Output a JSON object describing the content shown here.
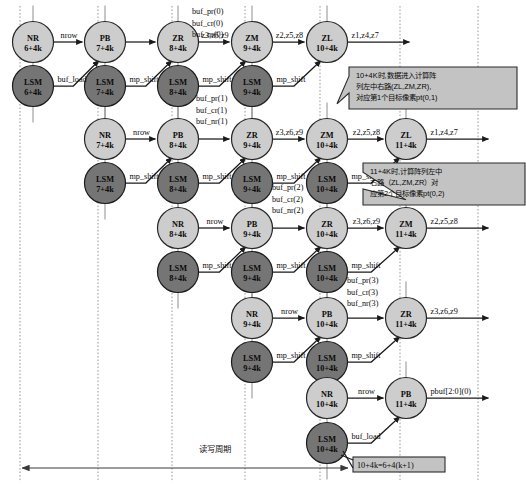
{
  "diagram": {
    "colors": {
      "node_light": "#cdcdcd",
      "node_dark": "#757575",
      "note_fill": "#c3c3c3",
      "edge": "#1a1a1a",
      "grid": "#9a9a9a"
    },
    "grid_columns_x": [
      20,
      98,
      172,
      245,
      320,
      400,
      478
    ],
    "rows": [
      {
        "index": 0,
        "top_nodes": [
          {
            "name": "NR",
            "cycle": "6+4k",
            "x": 33,
            "y": 42,
            "shade": "light"
          },
          {
            "name": "PB",
            "cycle": "7+4k",
            "x": 105,
            "y": 42,
            "shade": "light"
          },
          {
            "name": "ZR",
            "cycle": "8+4k",
            "x": 178,
            "y": 42,
            "shade": "light"
          },
          {
            "name": "ZM",
            "cycle": "9+4k",
            "x": 252,
            "y": 42,
            "shade": "light"
          },
          {
            "name": "ZL",
            "cycle": "10+4k",
            "x": 327,
            "y": 42,
            "shade": "light"
          }
        ],
        "bottom_nodes": [
          {
            "name": "LSM",
            "cycle": "6+4k",
            "x": 33,
            "y": 86,
            "shade": "dark"
          },
          {
            "name": "LSM",
            "cycle": "7+4k",
            "x": 105,
            "y": 86,
            "shade": "dark"
          },
          {
            "name": "LSM",
            "cycle": "8+4k",
            "x": 178,
            "y": 86,
            "shade": "dark"
          },
          {
            "name": "LSM",
            "cycle": "9+4k",
            "x": 252,
            "y": 86,
            "shade": "dark"
          }
        ],
        "top_edge_labels": [
          "nrow",
          "",
          "z3,z6,z9",
          "z2,z5,z8"
        ],
        "exit_label": "z1,z4,z7",
        "diag_labels": [
          "buf_load",
          "mp_shift",
          "mp_shift",
          "mp_shift"
        ],
        "stack_label": [
          "buf_pr(0)",
          "buf_cr(0)",
          "buf_nr(0)"
        ],
        "stack_label_x": 192,
        "stack_label_y": 14
      },
      {
        "index": 1,
        "top_nodes": [
          {
            "name": "NR",
            "cycle": "7+4k",
            "x": 105,
            "y": 139,
            "shade": "light"
          },
          {
            "name": "PB",
            "cycle": "8+4k",
            "x": 178,
            "y": 139,
            "shade": "light"
          },
          {
            "name": "ZR",
            "cycle": "9+4k",
            "x": 252,
            "y": 139,
            "shade": "light"
          },
          {
            "name": "ZM",
            "cycle": "10+4k",
            "x": 327,
            "y": 139,
            "shade": "light"
          },
          {
            "name": "ZL",
            "cycle": "11+4k",
            "x": 406,
            "y": 139,
            "shade": "light"
          }
        ],
        "bottom_nodes": [
          {
            "name": "LSM",
            "cycle": "7+4k",
            "x": 105,
            "y": 183,
            "shade": "dark"
          },
          {
            "name": "LSM",
            "cycle": "8+4k",
            "x": 178,
            "y": 183,
            "shade": "dark"
          },
          {
            "name": "LSM",
            "cycle": "9+4k",
            "x": 252,
            "y": 183,
            "shade": "dark"
          },
          {
            "name": "LSM",
            "cycle": "10+4k",
            "x": 327,
            "y": 183,
            "shade": "dark"
          }
        ],
        "top_edge_labels": [
          "nrow",
          "",
          "z3,z6,z9",
          "z2,z5,z8"
        ],
        "exit_label": "z1,z4,z7",
        "diag_labels": [
          "mp_shift",
          "mp_shift",
          "mp_shift",
          "mp_shift"
        ],
        "stack_label": [
          "buf_pr(1)",
          "buf_cr(1)",
          "buf_nr(1)"
        ],
        "stack_label_x": 196,
        "stack_label_y": 101
      },
      {
        "index": 2,
        "top_nodes": [
          {
            "name": "NR",
            "cycle": "8+4k",
            "x": 178,
            "y": 228,
            "shade": "light"
          },
          {
            "name": "PB",
            "cycle": "9+4k",
            "x": 252,
            "y": 228,
            "shade": "light"
          },
          {
            "name": "ZR",
            "cycle": "10+4k",
            "x": 327,
            "y": 228,
            "shade": "light"
          },
          {
            "name": "ZM",
            "cycle": "11+4k",
            "x": 406,
            "y": 228,
            "shade": "light"
          }
        ],
        "bottom_nodes": [
          {
            "name": "LSM",
            "cycle": "8+4k",
            "x": 178,
            "y": 272,
            "shade": "dark"
          },
          {
            "name": "LSM",
            "cycle": "9+4k",
            "x": 252,
            "y": 272,
            "shade": "dark"
          },
          {
            "name": "LSM",
            "cycle": "10+4k",
            "x": 327,
            "y": 272,
            "shade": "dark"
          }
        ],
        "top_edge_labels": [
          "nrow",
          "",
          "z3,z6,z9"
        ],
        "exit_label": "z2,z5,z8",
        "diag_labels": [
          "mp_shift",
          "mp_shift",
          "mp_shift"
        ],
        "stack_label": [
          "buf_pr(2)",
          "buf_cr(2)",
          "buf_nr(2)"
        ],
        "stack_label_x": 272,
        "stack_label_y": 190
      },
      {
        "index": 3,
        "top_nodes": [
          {
            "name": "NR",
            "cycle": "9+4k",
            "x": 252,
            "y": 318,
            "shade": "light"
          },
          {
            "name": "PB",
            "cycle": "10+4k",
            "x": 327,
            "y": 318,
            "shade": "light"
          },
          {
            "name": "ZR",
            "cycle": "11+4k",
            "x": 406,
            "y": 318,
            "shade": "light"
          }
        ],
        "bottom_nodes": [
          {
            "name": "LSM",
            "cycle": "9+4k",
            "x": 252,
            "y": 362,
            "shade": "dark"
          },
          {
            "name": "LSM",
            "cycle": "10+4k",
            "x": 327,
            "y": 362,
            "shade": "dark"
          }
        ],
        "top_edge_labels": [
          "nrow",
          ""
        ],
        "exit_label": "z3,z6,z9",
        "diag_labels": [
          "mp_shift",
          "mp_shift"
        ],
        "stack_label": [
          "buf_pr(3)",
          "buf_cr(3)",
          "buf_nr(3)"
        ],
        "stack_label_x": 347,
        "stack_label_y": 283
      },
      {
        "index": 4,
        "top_nodes": [
          {
            "name": "NR",
            "cycle": "10+4k",
            "x": 327,
            "y": 398,
            "shade": "light"
          },
          {
            "name": "PB",
            "cycle": "11+4k",
            "x": 406,
            "y": 398,
            "shade": "light"
          }
        ],
        "bottom_nodes": [
          {
            "name": "LSM",
            "cycle": "10+4k",
            "x": 327,
            "y": 443,
            "shade": "dark"
          }
        ],
        "top_edge_labels": [
          "nrow"
        ],
        "exit_label": "pbuf[2:0](0)",
        "diag_labels": [
          "buf_load"
        ],
        "stack_label": [],
        "stack_label_x": 0,
        "stack_label_y": 0
      }
    ],
    "callouts": [
      {
        "id": "callout-1",
        "lines": [
          "10+4K时,数据进入计算阵",
          "列左中右路(ZL,ZM,ZR),",
          "对应第1个目标像素pt(0,1)"
        ],
        "x": 349,
        "y": 67,
        "w": 168,
        "h": 42,
        "tail_x": 337,
        "tail_y": 82
      },
      {
        "id": "callout-2",
        "lines": [
          "11+4K时,计算阵列左中",
          "右路（ZL,ZM,ZR）对",
          "应第2个目标像素pt(0,2)"
        ],
        "x": 418,
        "y": 163,
        "w": 162,
        "h": 42,
        "tail_x": 406,
        "tail_y": 178
      }
    ],
    "equation_note": {
      "text": "10+4k=6+4(k+1)",
      "x": 353,
      "y": 457,
      "w": 92,
      "h": 15
    },
    "timeline": {
      "label": "读写周期",
      "label_x": 215,
      "label_y": 452,
      "x1": 22,
      "x2": 348,
      "y": 468
    }
  }
}
